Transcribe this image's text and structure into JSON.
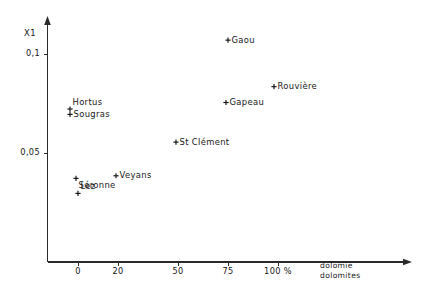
{
  "chart_data": {
    "type": "scatter",
    "title": "",
    "subtitle": "",
    "xlabel": "dolomie dolomites",
    "xlabel_lines": [
      "dolomie",
      "dolomites"
    ],
    "ylabel": "X1",
    "x_unit": "%",
    "xlim": [
      -12,
      168
    ],
    "ylim": [
      0.0,
      0.115
    ],
    "grid": false,
    "legend": "none",
    "x_ticks": [
      {
        "value": 0,
        "label": "0"
      },
      {
        "value": 20,
        "label": "20"
      },
      {
        "value": 50,
        "label": "50"
      },
      {
        "value": 75,
        "label": "75"
      },
      {
        "value": 100,
        "label": "100 %"
      }
    ],
    "y_ticks": [
      {
        "value": 0.1,
        "label": "0,1"
      },
      {
        "value": 0.05,
        "label": "0,05"
      }
    ],
    "points": [
      {
        "label": "Gaou",
        "x": 75,
        "y": 0.107,
        "label_pos": "right"
      },
      {
        "label": "Rouvière",
        "x": 98,
        "y": 0.0835,
        "label_pos": "right"
      },
      {
        "label": "Gapeau",
        "x": 74,
        "y": 0.0755,
        "label_pos": "right"
      },
      {
        "label": "Hortus",
        "x": -4,
        "y": 0.0722,
        "label_pos": "above-right"
      },
      {
        "label": "Sougras",
        "x": -4,
        "y": 0.0695,
        "label_pos": "right"
      },
      {
        "label": "St Clément",
        "x": 49,
        "y": 0.0555,
        "label_pos": "right"
      },
      {
        "label": "Veyans",
        "x": 19,
        "y": 0.0385,
        "label_pos": "right"
      },
      {
        "label": "Séronne",
        "x": -1,
        "y": 0.0372,
        "label_pos": "below-right"
      },
      {
        "label": "Lez",
        "x": 0,
        "y": 0.0296,
        "label_pos": "above-right"
      }
    ],
    "marker_style": "plus",
    "marker_color": "#111111",
    "axis_color": "#2a2a2a"
  }
}
